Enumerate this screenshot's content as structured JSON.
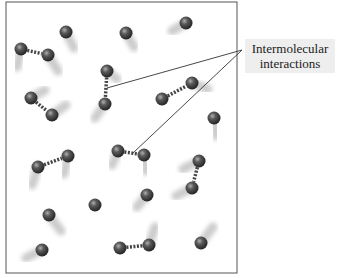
{
  "figure": {
    "label": {
      "line1": "Intermolecular",
      "line2": "interactions"
    },
    "container": {
      "x": 6,
      "y": 2,
      "width": 231,
      "height": 271,
      "stroke": "#555555"
    },
    "colors": {
      "molecule": "#3a3a3a",
      "molecule_highlight": "#9a9a9a",
      "motion_trail": "#bbbbbb",
      "interaction_dash": "#444444",
      "leader_line": "#333333",
      "label_bg": "#eeeeee"
    },
    "molecules": [
      {
        "x": 21,
        "y": 49,
        "trail_dx": -4,
        "trail_dy": 18
      },
      {
        "x": 48,
        "y": 55,
        "trail_dx": 10,
        "trail_dy": 16
      },
      {
        "x": 66,
        "y": 32,
        "trail_dx": 8,
        "trail_dy": 16
      },
      {
        "x": 126,
        "y": 33,
        "trail_dx": 8,
        "trail_dy": 14
      },
      {
        "x": 186,
        "y": 23,
        "trail_dx": -14,
        "trail_dy": 8
      },
      {
        "x": 107,
        "y": 71,
        "trail_dx": 10,
        "trail_dy": 8
      },
      {
        "x": 105,
        "y": 104,
        "trail_dx": -10,
        "trail_dy": 14
      },
      {
        "x": 31,
        "y": 98,
        "trail_dx": 14,
        "trail_dy": -8
      },
      {
        "x": 52,
        "y": 115,
        "trail_dx": 14,
        "trail_dy": -10
      },
      {
        "x": 162,
        "y": 99,
        "trail_dx": 0,
        "trail_dy": 16
      },
      {
        "x": 192,
        "y": 83,
        "trail_dx": 16,
        "trail_dy": 6
      },
      {
        "x": 214,
        "y": 118,
        "trail_dx": 2,
        "trail_dy": 18
      },
      {
        "x": 38,
        "y": 167,
        "trail_dx": -6,
        "trail_dy": 18
      },
      {
        "x": 68,
        "y": 156,
        "trail_dx": -4,
        "trail_dy": 18
      },
      {
        "x": 118,
        "y": 151,
        "trail_dx": -6,
        "trail_dy": 14
      },
      {
        "x": 144,
        "y": 155,
        "trail_dx": 2,
        "trail_dy": 16
      },
      {
        "x": 199,
        "y": 161,
        "trail_dx": -16,
        "trail_dy": 8
      },
      {
        "x": 192,
        "y": 188,
        "trail_dx": -16,
        "trail_dy": 8
      },
      {
        "x": 147,
        "y": 195,
        "trail_dx": -10,
        "trail_dy": 12
      },
      {
        "x": 95,
        "y": 205,
        "trail_dx": 0,
        "trail_dy": 18
      },
      {
        "x": 49,
        "y": 215,
        "trail_dx": 12,
        "trail_dy": 16
      },
      {
        "x": 201,
        "y": 243,
        "trail_dx": 12,
        "trail_dy": -16
      },
      {
        "x": 120,
        "y": 248,
        "trail_dx": 0,
        "trail_dy": -18
      },
      {
        "x": 149,
        "y": 245,
        "trail_dx": 6,
        "trail_dy": -18
      },
      {
        "x": 42,
        "y": 250,
        "trail_dx": -16,
        "trail_dy": 8
      }
    ],
    "interactions": [
      {
        "from": 0,
        "to": 1
      },
      {
        "from": 5,
        "to": 6
      },
      {
        "from": 7,
        "to": 8
      },
      {
        "from": 9,
        "to": 10
      },
      {
        "from": 12,
        "to": 13
      },
      {
        "from": 14,
        "to": 15
      },
      {
        "from": 16,
        "to": 17
      },
      {
        "from": 22,
        "to": 23
      }
    ],
    "leader_lines": [
      {
        "x1": 242,
        "y1": 50,
        "x2": 107,
        "y2": 88
      },
      {
        "x1": 242,
        "y1": 50,
        "x2": 133,
        "y2": 153
      }
    ]
  }
}
